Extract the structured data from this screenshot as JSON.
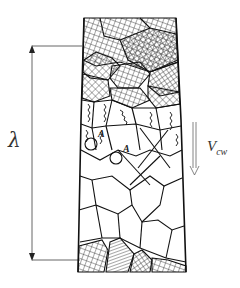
{
  "diagram": {
    "title": "",
    "labels": {
      "lambda": "λ",
      "velocity_main": "V",
      "velocity_sub": "cw",
      "marker_a_1": "A",
      "marker_a_2": "A"
    },
    "regions": [
      {
        "name": "cross-hatched-top-zone",
        "description": "fine cross-hatched grains at top"
      },
      {
        "name": "serrated-transition-zone",
        "description": "grains with serrated / zig-zag internal lines"
      },
      {
        "name": "plain-grain-zone",
        "description": "open polygonal grains"
      },
      {
        "name": "cross-hatched-bottom-zone",
        "description": "cross-hatched grains at bottom edge"
      }
    ],
    "dimension": {
      "label": "λ",
      "from_y": 46,
      "to_y": 260
    },
    "arrow_direction": "down",
    "colors": {
      "line": "#1a1a1a",
      "dimension_line": "#555555",
      "background": "#ffffff"
    }
  }
}
